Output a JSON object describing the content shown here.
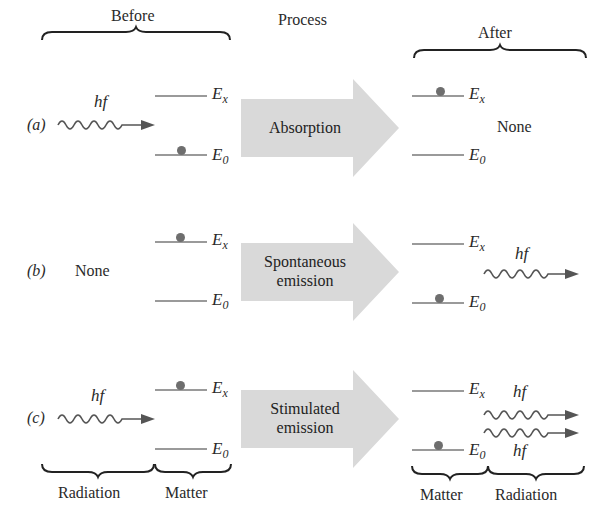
{
  "headers": {
    "before": "Before",
    "process": "Process",
    "after": "After"
  },
  "footers": {
    "left_radiation": "Radiation",
    "left_matter": "Matter",
    "right_matter": "Matter",
    "right_radiation": "Radiation"
  },
  "symbols": {
    "photon": "hf",
    "excited_level": "E",
    "excited_sub": "x",
    "ground_level": "E",
    "ground_sub": "0"
  },
  "rows": [
    {
      "tag": "(a)",
      "before_radiation": "photon",
      "before_electron": "ground",
      "process": [
        "Absorption"
      ],
      "after_electron": "excited",
      "after_radiation": "None"
    },
    {
      "tag": "(b)",
      "before_radiation": "None",
      "before_electron": "excited",
      "process": [
        "Spontaneous",
        "emission"
      ],
      "after_electron": "ground",
      "after_radiation": "1 photon"
    },
    {
      "tag": "(c)",
      "before_radiation": "photon",
      "before_electron": "excited",
      "process": [
        "Stimulated",
        "emission"
      ],
      "after_electron": "ground",
      "after_radiation": "2 photons"
    }
  ],
  "colors": {
    "arrow_fill": "#d9d9d9",
    "level_line": "#9a9a9a",
    "electron": "#6e6e6e",
    "text": "#2a2a2a"
  }
}
